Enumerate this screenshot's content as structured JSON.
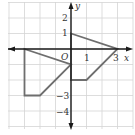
{
  "figure": {
    "type": "coordinate-plane",
    "axes": {
      "x_label": "x",
      "y_label": "y",
      "origin_label": "O",
      "x_tick_labels": [
        {
          "value": 1,
          "text": "1"
        },
        {
          "value": 3,
          "text": "3"
        }
      ],
      "y_tick_labels": [
        {
          "value": 2,
          "text": "2"
        },
        {
          "value": 1,
          "text": "1"
        },
        {
          "value": -3,
          "text": "−3"
        },
        {
          "value": -4,
          "text": "−4"
        }
      ],
      "x_range": [
        -4,
        4
      ],
      "y_range": [
        -5,
        3
      ],
      "grid": true
    },
    "shapes": [
      {
        "name": "figure-right",
        "vertices": [
          [
            0,
            1
          ],
          [
            3,
            0
          ],
          [
            1,
            -2
          ],
          [
            0,
            -2
          ]
        ]
      },
      {
        "name": "figure-left",
        "vertices": [
          [
            -3,
            0
          ],
          [
            0,
            -1
          ],
          [
            -2,
            -3
          ],
          [
            -3,
            -3
          ]
        ]
      }
    ],
    "colors": {
      "grid": "#d4d4d4",
      "axis": "#1a1a1a",
      "shape_stroke": "#6e6e6e",
      "text": "#333333"
    }
  }
}
